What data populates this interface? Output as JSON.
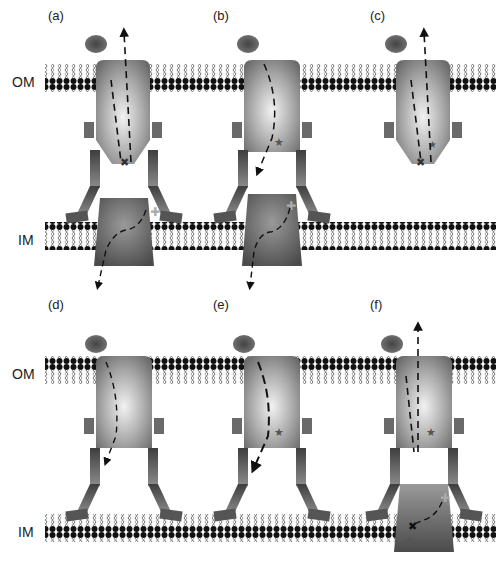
{
  "panels": [
    {
      "id": "a",
      "label": "(a)"
    },
    {
      "id": "b",
      "label": "(b)"
    },
    {
      "id": "c",
      "label": "(c)"
    },
    {
      "id": "d",
      "label": "(d)"
    },
    {
      "id": "e",
      "label": "(e)"
    },
    {
      "id": "f",
      "label": "(f)"
    }
  ],
  "membranes": {
    "outer": "OM",
    "inner": "IM"
  },
  "colors": {
    "head_group": "#111111",
    "ligand": "#555555",
    "channel_light": "#e8e8e8",
    "channel_dark": "#6a6a6a",
    "leg": "#585858",
    "star": "#5a5a5a",
    "plus": "#999999"
  }
}
